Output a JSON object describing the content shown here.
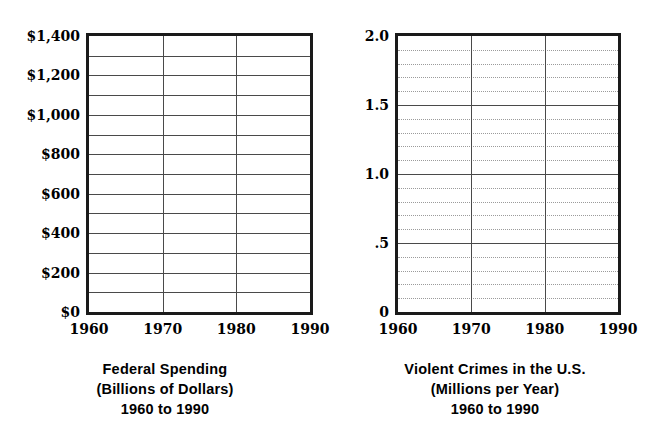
{
  "figures": [
    {
      "id": "federal-spending",
      "caption": {
        "line1": "Federal Spending",
        "line2": "(Billions of Dollars)",
        "line3": "1960 to 1990"
      },
      "chart_data": {
        "type": "line",
        "title": "Federal Spending",
        "subtitle": "(Billions of Dollars)",
        "range_label": "1960 to 1990",
        "xlabel": "",
        "ylabel": "Billions of Dollars",
        "x": [
          1960,
          1970,
          1980,
          1990
        ],
        "xtick_labels": [
          "1960",
          "1970",
          "1980",
          "1990"
        ],
        "xlim": [
          1960,
          1990
        ],
        "ylim": [
          0,
          1400
        ],
        "ytick_labels": [
          "$0",
          "$200",
          "$400",
          "$600",
          "$800",
          "$1,000",
          "$1,200",
          "$1,400"
        ],
        "ytick_values": [
          0,
          200,
          400,
          600,
          800,
          1000,
          1200,
          1400
        ],
        "y_minor_step": 100,
        "grid": "major-solid-horizontal-and-vertical",
        "minor_grid_style": "solid",
        "legend": "none",
        "series": [],
        "note": "Blank grid template; no data plotted."
      }
    },
    {
      "id": "violent-crimes",
      "caption": {
        "line1": "Violent Crimes in the U.S.",
        "line2": "(Millions per Year)",
        "line3": "1960 to 1990"
      },
      "chart_data": {
        "type": "line",
        "title": "Violent Crimes in the U.S.",
        "subtitle": "(Millions per Year)",
        "range_label": "1960 to 1990",
        "xlabel": "",
        "ylabel": "Millions per Year",
        "x": [
          1960,
          1970,
          1980,
          1990
        ],
        "xtick_labels": [
          "1960",
          "1970",
          "1980",
          "1990"
        ],
        "xlim": [
          1960,
          1990
        ],
        "ylim": [
          0,
          2.0
        ],
        "ytick_labels": [
          "0",
          ".5",
          "1.0",
          "1.5",
          "2.0"
        ],
        "ytick_values": [
          0,
          0.5,
          1.0,
          1.5,
          2.0
        ],
        "y_minor_step": 0.1,
        "grid": "major-solid-horizontal-and-vertical",
        "minor_grid_style": "dotted",
        "legend": "none",
        "series": [],
        "note": "Blank grid template; no data plotted."
      }
    }
  ],
  "colors": {
    "frame": "#1a1a1a",
    "gridline": "#4a4a4a",
    "minor_gridline": "#9b9b9b",
    "background": "#ffffff",
    "text": "#000000"
  }
}
